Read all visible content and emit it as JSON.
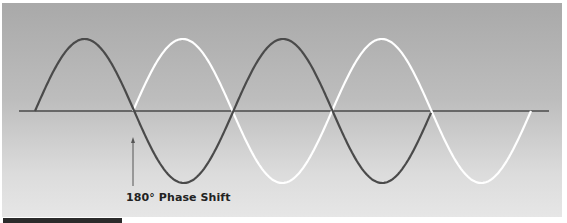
{
  "diagram": {
    "title": "180° Phase Shift",
    "annotation": {
      "label": "180° Phase Shift",
      "points_to_x": 133
    },
    "colors": {
      "background_top": "#a9a9a9",
      "background_bottom": "#e6e6e6",
      "wave_a": "#4a4a4a",
      "wave_b": "#ffffff",
      "axis": "#4a4a4a",
      "bottom_bar": "#2b2b2b"
    },
    "axis": {
      "y": 111,
      "x_start": 19,
      "x_end": 549
    },
    "waves": [
      {
        "name": "reference-wave",
        "color": "dark",
        "start_x": 35,
        "end_x": 431,
        "half_period": 99.2,
        "amplitude": 72,
        "starts_positive": true
      },
      {
        "name": "shifted-wave",
        "color": "white",
        "start_x": 133,
        "end_x": 531,
        "half_period": 99.5,
        "amplitude": 72,
        "starts_positive": true,
        "phase_shift_degrees": 180
      }
    ]
  }
}
